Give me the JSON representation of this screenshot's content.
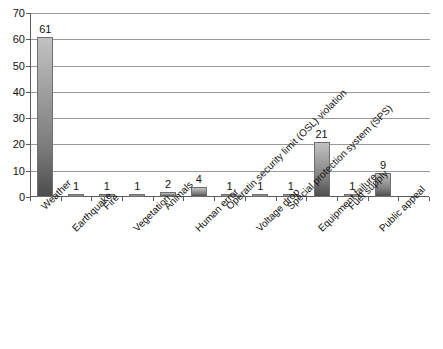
{
  "chart_data": {
    "type": "bar",
    "title": "",
    "subtitle": "",
    "xlabel": "",
    "ylabel": "",
    "ylim": [
      0,
      70
    ],
    "ytick_step": 10,
    "yticks": [
      "70",
      "60",
      "50",
      "40",
      "30",
      "20",
      "10",
      "0"
    ],
    "grid": true,
    "legend": false,
    "legend_position": "none",
    "bar_color_top": "#c2c2c2",
    "bar_color_bottom": "#4d4d4d",
    "bar_border_color": "#6f6f6f",
    "gridline_color": "#9a9a9a",
    "axis_color": "#5a5a5a",
    "categories": [
      "Weather",
      "Earthquake",
      "Fire",
      "Vegetation",
      "Animals",
      "Human error",
      "Operatin security limit (OSL) violation",
      "Voltage drop",
      "Special protection system (SPS)",
      "Equipment failure",
      "Fuel supply",
      "Public appeal"
    ],
    "values": [
      61,
      1,
      1,
      1,
      2,
      4,
      1,
      1,
      1,
      21,
      1,
      9
    ],
    "value_labels": [
      "61",
      "1",
      "1",
      "1",
      "2",
      "4",
      "1",
      "1",
      "1",
      "21",
      "1",
      "9"
    ]
  }
}
